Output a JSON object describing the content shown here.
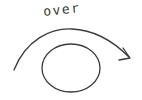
{
  "diagram": {
    "label": "over",
    "colors": {
      "stroke": "#3a3a3a",
      "background": "#ffffff"
    },
    "shapes": {
      "ellipse": {
        "cx": 71,
        "cy": 68,
        "rx": 29,
        "ry": 24
      },
      "arrow": {
        "from": [
          14,
          70
        ],
        "to": [
          130,
          58
        ],
        "direction": "left-to-right, arcing over the ellipse"
      }
    }
  }
}
